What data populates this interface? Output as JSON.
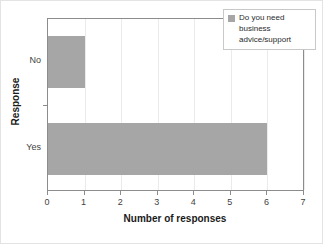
{
  "chart_data": {
    "type": "bar",
    "orientation": "horizontal",
    "title": "",
    "xlabel": "Number of responses",
    "ylabel": "Response",
    "categories": [
      "No",
      "Yes"
    ],
    "values": [
      1,
      6
    ],
    "series": [
      {
        "name": "Do you need business advice/support",
        "values": [
          1,
          6
        ],
        "color": "#a6a6a6"
      }
    ],
    "xlim": [
      0,
      7
    ],
    "xticks": [
      "0",
      "1",
      "2",
      "3",
      "4",
      "5",
      "6",
      "7"
    ],
    "grid": "vertical",
    "legend_position": "top-right"
  },
  "legend": {
    "label": "Do you need business advice/support",
    "swatch_color": "#a6a6a6"
  },
  "axes": {
    "x_title": "Number of responses",
    "y_title": "Response"
  }
}
